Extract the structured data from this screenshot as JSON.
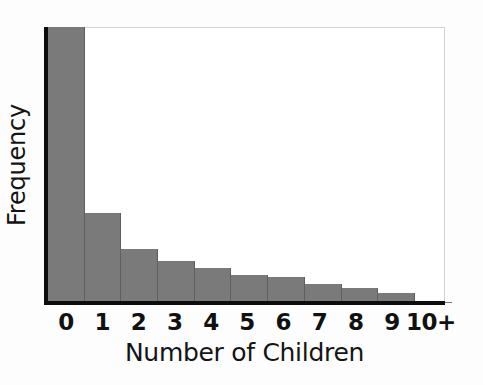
{
  "chart_data": {
    "type": "bar",
    "title": "",
    "subtitle": "",
    "xlabel": "Number of Children",
    "ylabel": "Frequency",
    "categories": [
      "0",
      "1",
      "2",
      "3",
      "4",
      "5",
      "6",
      "7",
      "8",
      "9",
      "10+"
    ],
    "values": [
      100,
      32.5,
      19.7,
      15.4,
      12.8,
      10.3,
      9.5,
      7.0,
      5.5,
      3.6,
      0.4
    ],
    "value_units": "percent of maximum frequency",
    "ytick_labels": [],
    "xtick_labels": [
      "0",
      "1",
      "2",
      "3",
      "4",
      "5",
      "6",
      "7",
      "8",
      "9",
      "10+"
    ],
    "ylim": [
      0,
      100
    ],
    "grid": false,
    "legend": false,
    "legend_position": "none",
    "annotations": [],
    "colors": {
      "bar_fill": "#7a7a7a",
      "bar_edge": "#5f5f5f",
      "axis": "#0d0d0d",
      "frame": "#d2d2d2",
      "background": "#ffffff",
      "text": "#141414"
    }
  }
}
